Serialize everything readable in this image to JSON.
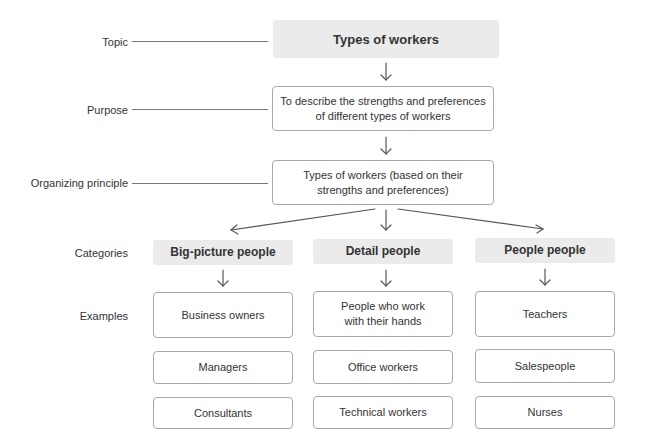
{
  "row_labels": {
    "topic": "Topic",
    "purpose": "Purpose",
    "organizing_principle": "Organizing principle",
    "categories": "Categories",
    "examples": "Examples"
  },
  "topic": "Types of workers",
  "purpose": {
    "line1": "To describe the strengths and preferences",
    "line2": "of different types of workers"
  },
  "organizing_principle": {
    "line1": "Types of workers (based on their",
    "line2": "strengths and preferences)"
  },
  "columns": [
    {
      "category": "Big-picture people",
      "examples": [
        {
          "line1": "Business owners",
          "line2": ""
        },
        {
          "line1": "Managers",
          "line2": ""
        },
        {
          "line1": "Consultants",
          "line2": ""
        }
      ]
    },
    {
      "category": "Detail people",
      "examples": [
        {
          "line1": "People who work",
          "line2": "with their hands"
        },
        {
          "line1": "Office workers",
          "line2": ""
        },
        {
          "line1": "Technical workers",
          "line2": ""
        }
      ]
    },
    {
      "category": "People people",
      "examples": [
        {
          "line1": "Teachers",
          "line2": ""
        },
        {
          "line1": "Salespeople",
          "line2": ""
        },
        {
          "line1": "Nurses",
          "line2": ""
        }
      ]
    }
  ],
  "colors": {
    "filled_box": "#ebebeb",
    "outline_border": "#a8a8a8",
    "text": "#333333",
    "arrow": "#555555"
  }
}
